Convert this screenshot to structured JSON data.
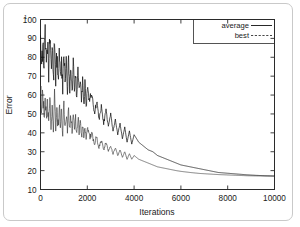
{
  "figure": {
    "name": "error-vs-iterations-convergence-plot",
    "background_color": "#ffffff",
    "line_color": "#111111"
  },
  "chart_data": {
    "type": "line",
    "title": "",
    "xlabel": "Iterations",
    "ylabel": "Error",
    "xlim": [
      0,
      10000
    ],
    "ylim": [
      10,
      100
    ],
    "xticks": [
      0,
      2000,
      4000,
      6000,
      8000,
      10000
    ],
    "xtick_labels": [
      "0",
      "2000",
      "4000",
      "6000",
      "8000",
      "10000"
    ],
    "yticks": [
      10,
      20,
      30,
      40,
      50,
      60,
      70,
      80,
      90,
      100
    ],
    "ytick_labels": [
      "10",
      "20",
      "30",
      "40",
      "50",
      "60",
      "70",
      "80",
      "90",
      "100"
    ],
    "ytick_prefix_artifact": "1",
    "grid": false,
    "legend_position": "top-right",
    "legend": [
      {
        "name": "average",
        "style": "solid"
      },
      {
        "name": "best",
        "style": "dashed"
      }
    ],
    "series": [
      {
        "name": "average",
        "style": "solid",
        "x": [
          0,
          50,
          100,
          150,
          200,
          250,
          300,
          350,
          400,
          450,
          500,
          550,
          600,
          650,
          700,
          750,
          800,
          850,
          900,
          950,
          1000,
          1050,
          1100,
          1150,
          1200,
          1250,
          1300,
          1350,
          1400,
          1450,
          1500,
          1550,
          1600,
          1650,
          1700,
          1750,
          1800,
          1850,
          1900,
          1950,
          2000,
          2100,
          2200,
          2300,
          2400,
          2500,
          2600,
          2700,
          2800,
          2900,
          3000,
          3100,
          3200,
          3300,
          3400,
          3500,
          3600,
          3700,
          3800,
          3900,
          4000,
          4200,
          4400,
          4600,
          4800,
          5000,
          5200,
          5400,
          5600,
          5800,
          6000,
          6400,
          6800,
          7200,
          7600,
          8000,
          8400,
          8800,
          9200,
          9600,
          10000
        ],
        "y": [
          96,
          80,
          88,
          76,
          92,
          72,
          86,
          70,
          90,
          74,
          83,
          68,
          87,
          71,
          80,
          66,
          85,
          69,
          78,
          64,
          82,
          67,
          76,
          62,
          79,
          65,
          74,
          60,
          77,
          63,
          72,
          58,
          75,
          61,
          70,
          56,
          68,
          54,
          66,
          52,
          63,
          58,
          60,
          50,
          57,
          47,
          54,
          45,
          52,
          43,
          50,
          41,
          47,
          39,
          45,
          37,
          43,
          35,
          41,
          34,
          39,
          35,
          33,
          31,
          30,
          28,
          27,
          26,
          25,
          24,
          23,
          22,
          21,
          20,
          19,
          18.6,
          18.2,
          17.8,
          17.5,
          17.3,
          17.2
        ]
      },
      {
        "name": "best",
        "style": "dashed",
        "x": [
          0,
          50,
          100,
          150,
          200,
          250,
          300,
          350,
          400,
          450,
          500,
          550,
          600,
          650,
          700,
          750,
          800,
          850,
          900,
          950,
          1000,
          1050,
          1100,
          1150,
          1200,
          1250,
          1300,
          1350,
          1400,
          1450,
          1500,
          1550,
          1600,
          1650,
          1700,
          1750,
          1800,
          1850,
          1900,
          1950,
          2000,
          2100,
          2200,
          2300,
          2400,
          2500,
          2600,
          2700,
          2800,
          2900,
          3000,
          3100,
          3200,
          3300,
          3400,
          3500,
          3600,
          3700,
          3800,
          3900,
          4000,
          4200,
          4400,
          4600,
          4800,
          5000,
          5200,
          5400,
          5600,
          5800,
          6000,
          6400,
          6800,
          7200,
          7600,
          8000,
          8400,
          8800,
          9200,
          9600,
          10000
        ],
        "y": [
          62,
          52,
          60,
          48,
          64,
          46,
          58,
          45,
          61,
          47,
          56,
          44,
          59,
          45,
          54,
          43,
          57,
          44,
          52,
          42,
          55,
          43,
          50,
          41,
          53,
          42,
          48,
          40,
          51,
          41,
          47,
          39,
          49,
          40,
          45,
          38,
          44,
          37,
          43,
          36,
          42,
          38,
          40,
          34,
          38,
          32,
          36,
          31,
          35,
          30,
          33,
          29,
          32,
          28,
          31,
          27,
          30,
          26,
          29,
          26,
          28,
          26,
          25,
          24,
          23,
          22,
          21.5,
          21,
          20.5,
          20,
          19.6,
          19,
          18.5,
          18.2,
          17.9,
          17.7,
          17.5,
          17.3,
          17.2,
          17.1,
          17.0
        ]
      }
    ]
  }
}
